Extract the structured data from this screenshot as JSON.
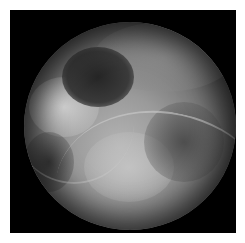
{
  "image": {
    "description": "Grayscale endoscopic/arthroscopic circular view inside black square frame",
    "background_color": "#ffffff",
    "frame_color": "#000000"
  }
}
